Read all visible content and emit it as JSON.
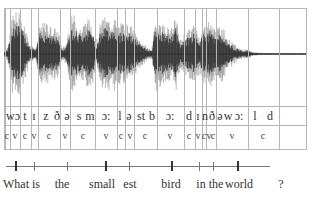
{
  "figure": {
    "waveform": {
      "color_dark": "#1a1a1a",
      "color_light": "#8a8a8a",
      "baseline_y": 54
    },
    "segment_boundaries_x": [
      5,
      10,
      20,
      31,
      38,
      60,
      70,
      95,
      117,
      125,
      134,
      157,
      184,
      195,
      202,
      206,
      216,
      248,
      279,
      306
    ],
    "phonemes": [
      {
        "text": "wɔ",
        "x": 13
      },
      {
        "text": "t",
        "x": 25
      },
      {
        "text": "ɪ",
        "x": 34
      },
      {
        "text": "z",
        "x": 46
      },
      {
        "text": "ð",
        "x": 57
      },
      {
        "text": "ə",
        "x": 67
      },
      {
        "text": "s",
        "x": 79
      },
      {
        "text": "m",
        "x": 90
      },
      {
        "text": "ɔ:",
        "x": 106
      },
      {
        "text": "l",
        "x": 120
      },
      {
        "text": "ə",
        "x": 129
      },
      {
        "text": "st",
        "x": 141
      },
      {
        "text": "b",
        "x": 152
      },
      {
        "text": "ɔ:",
        "x": 170
      },
      {
        "text": "d",
        "x": 189
      },
      {
        "text": "ɪ",
        "x": 198
      },
      {
        "text": "n",
        "x": 205
      },
      {
        "text": "ð",
        "x": 212
      },
      {
        "text": "ə",
        "x": 220
      },
      {
        "text": "w",
        "x": 228
      },
      {
        "text": "ɔ:",
        "x": 239
      },
      {
        "text": "l",
        "x": 255
      },
      {
        "text": "d",
        "x": 270
      }
    ],
    "cv_labels": [
      {
        "text": "c",
        "x": 7
      },
      {
        "text": "v",
        "x": 15
      },
      {
        "text": "c",
        "x": 25
      },
      {
        "text": "v",
        "x": 34
      },
      {
        "text": "c",
        "x": 49
      },
      {
        "text": "v",
        "x": 65
      },
      {
        "text": "c",
        "x": 83
      },
      {
        "text": "v",
        "x": 106
      },
      {
        "text": "c",
        "x": 121
      },
      {
        "text": "v",
        "x": 130
      },
      {
        "text": "c",
        "x": 145
      },
      {
        "text": "v",
        "x": 170
      },
      {
        "text": "c",
        "x": 189
      },
      {
        "text": "v",
        "x": 198
      },
      {
        "text": "c",
        "x": 204
      },
      {
        "text": "v",
        "x": 209
      },
      {
        "text": "c",
        "x": 213
      },
      {
        "text": "v",
        "x": 232
      },
      {
        "text": "c",
        "x": 263
      }
    ],
    "timeline": {
      "ticks": [
        {
          "x": 15,
          "major": true
        },
        {
          "x": 34,
          "major": false
        },
        {
          "x": 67,
          "major": false
        },
        {
          "x": 105,
          "major": true
        },
        {
          "x": 129,
          "major": false
        },
        {
          "x": 171,
          "major": true
        },
        {
          "x": 199,
          "major": false
        },
        {
          "x": 213,
          "major": false
        },
        {
          "x": 237,
          "major": true
        }
      ],
      "words": [
        {
          "text": "What",
          "x": 16
        },
        {
          "text": "is",
          "x": 36
        },
        {
          "text": "the",
          "x": 62
        },
        {
          "text": "small",
          "x": 102
        },
        {
          "text": "est",
          "x": 130
        },
        {
          "text": "bird",
          "x": 171
        },
        {
          "text": "in",
          "x": 201
        },
        {
          "text": "the",
          "x": 216
        },
        {
          "text": "world",
          "x": 239
        },
        {
          "text": "?",
          "x": 281
        }
      ]
    }
  }
}
